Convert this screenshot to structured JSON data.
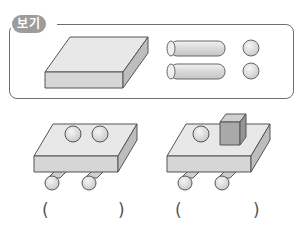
{
  "example_box": {
    "label": "보기",
    "items": [
      {
        "shape": "rectangular-slab",
        "count": 1
      },
      {
        "shape": "cylinder",
        "count": 2
      },
      {
        "shape": "sphere",
        "count": 2
      }
    ]
  },
  "figures": [
    {
      "name": "figure-1",
      "parts": [
        "slab",
        "sphere",
        "sphere",
        "cylinder",
        "cylinder"
      ],
      "answer_open": "(",
      "answer_close": ")"
    },
    {
      "name": "figure-2",
      "parts": [
        "slab",
        "sphere",
        "cube",
        "cylinder",
        "cylinder"
      ],
      "answer_open": "(",
      "answer_close": ")"
    }
  ],
  "colors": {
    "badge": "#9c9c9c",
    "outline": "#6e6e6e",
    "face_top": "#e8e8e8",
    "face_front": "#d6d6d6",
    "face_side": "#bdbdbd"
  }
}
